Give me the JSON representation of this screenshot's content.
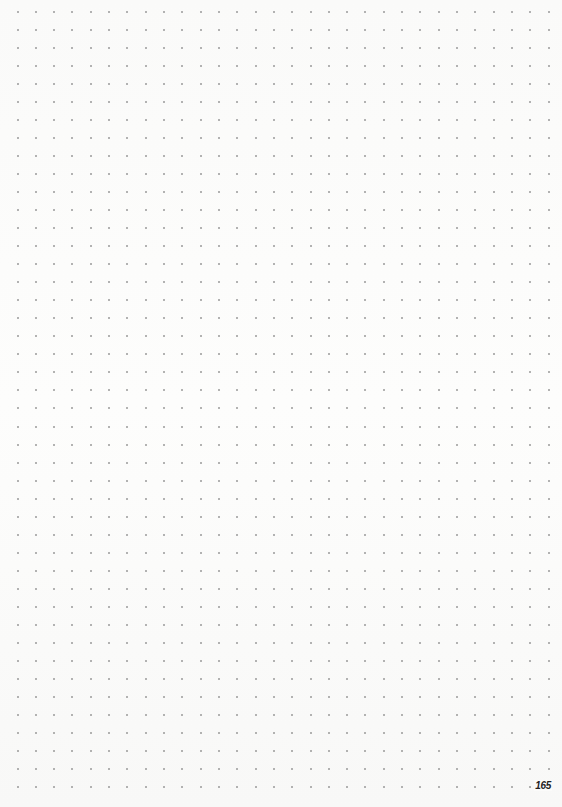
{
  "page": {
    "type": "dot-grid notebook page",
    "page_number": "165",
    "background_color": "#fbfbfa",
    "dot_color": "#9a9a9a"
  },
  "grid": {
    "columns": 30,
    "rows": 44,
    "origin_x": 17.5,
    "origin_y": 12,
    "step_x": 18.31,
    "step_y": 18.02
  }
}
